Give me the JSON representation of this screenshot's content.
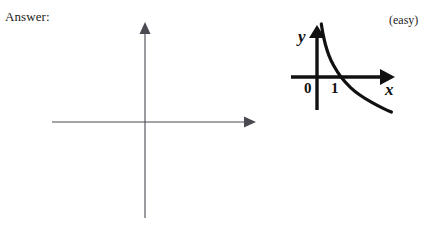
{
  "page": {
    "background_color": "#ffffff",
    "width": 443,
    "height": 235
  },
  "header": {
    "answer_label": "Answer:",
    "difficulty_label": "(easy)"
  },
  "blank_axes": {
    "name": "empty coordinate axes for student answer",
    "x_axis_label": "",
    "y_axis_label": "",
    "line_color": "#4a4a52",
    "has_x_arrow": true,
    "has_y_arrow": true
  },
  "answer_graph": {
    "title": "",
    "line_color": "#111111",
    "y_axis_label": "y",
    "x_axis_label": "x",
    "origin_label": "0",
    "tick_label": "1",
    "has_x_arrow": true,
    "has_y_arrow": true
  },
  "chart_data": {
    "type": "line",
    "title": "",
    "subtitle": "",
    "xlabel": "x",
    "ylabel": "y",
    "xlim": [
      0,
      3.2
    ],
    "ylim": [
      -1.4,
      1.8
    ],
    "grid": false,
    "legend": "none",
    "xticks": [
      0,
      1
    ],
    "xticklabels": [
      "0",
      "1"
    ],
    "yticks": [],
    "yticklabels": [],
    "annotations": [
      "curve crosses the x-axis at x = 1"
    ],
    "series": [
      {
        "name": "y = -ln(x)",
        "x": [
          0.18,
          0.25,
          0.35,
          0.5,
          0.7,
          1.0,
          1.4,
          1.8,
          2.3,
          2.8,
          3.1
        ],
        "y": [
          1.71,
          1.39,
          1.05,
          0.69,
          0.36,
          0.0,
          -0.34,
          -0.59,
          -0.83,
          -1.03,
          -1.13
        ]
      }
    ]
  }
}
